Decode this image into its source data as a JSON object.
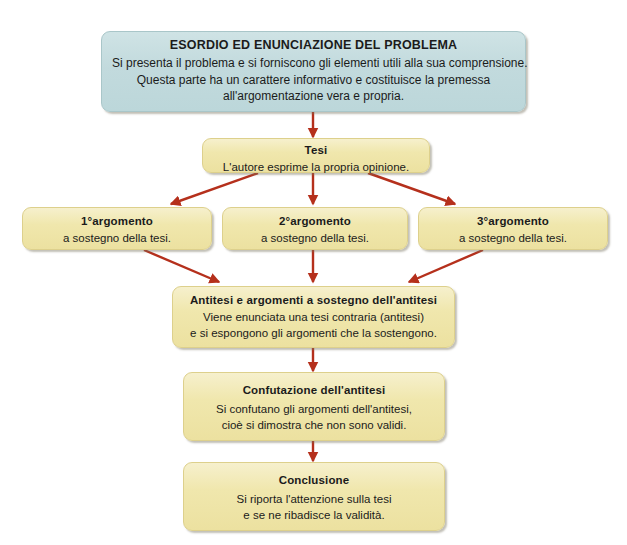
{
  "diagram": {
    "clipped_header_text": "",
    "colors": {
      "background": "#ffffff",
      "blue_box_fill": "#c2dadd",
      "blue_box_border": "#a9c6c9",
      "cream_box_fill": "#f0e7ad",
      "cream_box_border": "#ddd08c",
      "arrow": "#b5301c",
      "text": "#1b1b1b"
    },
    "nodes": [
      {
        "id": "esordio",
        "style": "blue",
        "title": "ESORDIO ED ENUNCIAZIONE DEL PROBLEMA",
        "lines": [
          "Si presenta il problema e si forniscono gli elementi utili alla sua comprensione.",
          "Questa parte ha un carattere informativo e costituisce la premessa",
          "all'argomentazione vera e propria."
        ]
      },
      {
        "id": "tesi",
        "style": "cream",
        "title": "Tesi",
        "lines": [
          "L'autore esprime la propria opinione."
        ]
      },
      {
        "id": "argomento1",
        "style": "cream",
        "title": "1°argomento",
        "lines": [
          "a sostegno della tesi."
        ]
      },
      {
        "id": "argomento2",
        "style": "cream",
        "title": "2°argomento",
        "lines": [
          "a sostegno della tesi."
        ]
      },
      {
        "id": "argomento3",
        "style": "cream",
        "title": "3°argomento",
        "lines": [
          "a sostegno della tesi."
        ]
      },
      {
        "id": "antitesi",
        "style": "cream",
        "title": "Antitesi e argomenti a sostegno dell'antitesi",
        "lines": [
          "Viene enunciata una tesi contraria (antitesi)",
          "e si espongono gli argomenti che la sostengono."
        ]
      },
      {
        "id": "confutazione",
        "style": "cream",
        "title": "Confutazione dell'antitesi",
        "lines": [
          "Si confutano gli argomenti dell'antitesi,",
          "cioè si dimostra che non sono validi."
        ]
      },
      {
        "id": "conclusione",
        "style": "cream",
        "title": "Conclusione",
        "lines": [
          "Si riporta l'attenzione sulla tesi",
          "e se ne ribadisce la validità."
        ]
      }
    ],
    "edges": [
      {
        "from": "esordio",
        "to": "tesi",
        "shape": "straight"
      },
      {
        "from": "tesi",
        "to": "argomento1",
        "shape": "diagonal-left"
      },
      {
        "from": "tesi",
        "to": "argomento2",
        "shape": "straight"
      },
      {
        "from": "tesi",
        "to": "argomento3",
        "shape": "diagonal-right"
      },
      {
        "from": "argomento1",
        "to": "antitesi",
        "shape": "diagonal-right"
      },
      {
        "from": "argomento2",
        "to": "antitesi",
        "shape": "straight"
      },
      {
        "from": "argomento3",
        "to": "antitesi",
        "shape": "diagonal-left"
      },
      {
        "from": "antitesi",
        "to": "confutazione",
        "shape": "straight"
      },
      {
        "from": "confutazione",
        "to": "conclusione",
        "shape": "straight"
      }
    ]
  }
}
